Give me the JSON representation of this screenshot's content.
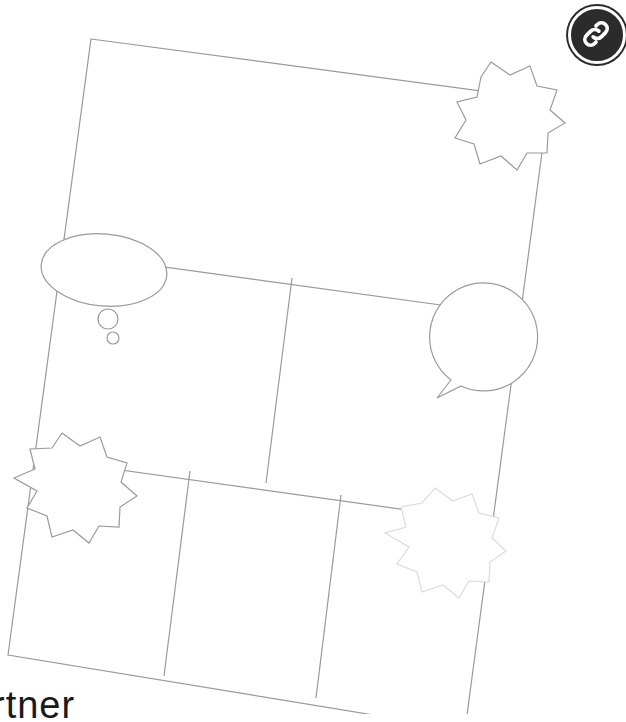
{
  "caption": {
    "text": "rtner"
  },
  "badge": {
    "icon": "link-icon",
    "fill": "#2b2b2b"
  },
  "template": {
    "stroke": "#9a9a9a",
    "faded_stroke": "#dcdcdc",
    "panels": 6,
    "elements": [
      "starburst-top-right",
      "thought-bubble",
      "speech-bubble",
      "starburst-left",
      "starburst-bottom-right"
    ]
  }
}
